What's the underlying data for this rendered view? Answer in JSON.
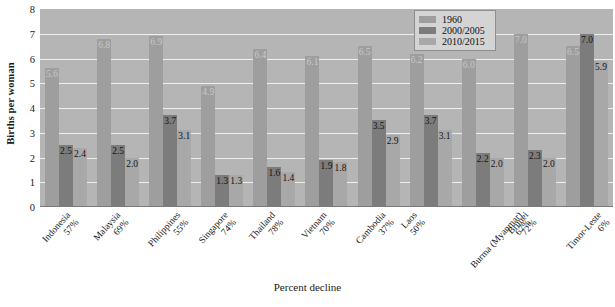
{
  "chart_data": {
    "type": "bar",
    "title": "",
    "xlabel": "Percent decline",
    "ylabel": "Births per woman",
    "ylim": [
      0,
      8
    ],
    "yticks": [
      "0",
      "1",
      "2",
      "3",
      "4",
      "5",
      "6",
      "7",
      "8"
    ],
    "grid": true,
    "legend_position": "top-right",
    "categories": [
      "Indonesia",
      "Malaysia",
      "Philippines",
      "Singapore",
      "Thailand",
      "Vietnam",
      "Cambodia",
      "Laos",
      "Burma (Myanmar)",
      "Brunei",
      "Timor-Leste"
    ],
    "category_sublabels": [
      "57%",
      "69%",
      "55%",
      "74%",
      "78%",
      "70%",
      "37%",
      "50%",
      "67%",
      "72%",
      "6%"
    ],
    "series": [
      {
        "name": "1960",
        "color": "#9e9e9e",
        "values": [
          5.6,
          6.8,
          6.9,
          4.9,
          6.4,
          6.1,
          6.5,
          6.2,
          6.0,
          7.0,
          6.5
        ],
        "labels": [
          "5.6",
          "6.8",
          "6.9",
          "4.9",
          "6.4",
          "6.1",
          "6.5",
          "6.2",
          "6.0",
          "7.0",
          "6.5"
        ]
      },
      {
        "name": "2000/2005",
        "color": "#7c7c7c",
        "values": [
          2.5,
          2.5,
          3.7,
          1.3,
          1.6,
          1.9,
          3.5,
          3.7,
          2.2,
          2.3,
          7.0
        ],
        "labels": [
          "2.5",
          "2.5",
          "3.7",
          "1.3",
          "1.6",
          "1.9",
          "3.5",
          "3.7",
          "2.2",
          "2.3",
          "7.0"
        ]
      },
      {
        "name": "2010/2015",
        "color": "#a8a8a8",
        "values": [
          2.4,
          2.0,
          3.1,
          1.3,
          1.4,
          1.8,
          2.9,
          3.1,
          2.0,
          2.0,
          5.9
        ],
        "labels": [
          "2.4",
          "2.0",
          "3.1",
          "1.3",
          "1.4",
          "1.8",
          "2.9",
          "3.1",
          "2.0",
          "2.0",
          "5.9"
        ]
      }
    ]
  },
  "colors": {
    "plot_background": "#b5b5b5",
    "gridline": "#efefef",
    "legend_background": "#d4d4d4",
    "legend_border": "#8e8e8e"
  }
}
